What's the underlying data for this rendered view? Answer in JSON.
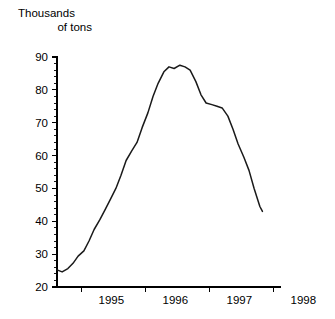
{
  "chart_data": {
    "type": "line",
    "title": "Thousands of tons",
    "title_line1": "Thousands",
    "title_line2": "of tons",
    "xlabel": "",
    "ylabel": "Thousands of tons",
    "ylim": [
      20,
      90
    ],
    "xlim": [
      "1994.62",
      "1997.83"
    ],
    "grid": false,
    "legend": false,
    "line_color": "#1a1a1a",
    "background_color": "#ffffff",
    "y_ticks": [
      20,
      30,
      40,
      50,
      60,
      70,
      80,
      90
    ],
    "y_tick_labels": [
      "20",
      "30",
      "40",
      "50",
      "60",
      "70",
      "80",
      "90"
    ],
    "y_minor_tick_step": 2,
    "x_ticks": [
      1995,
      1996,
      1997,
      1998
    ],
    "x_tick_labels": [
      "1995",
      "1996",
      "1997",
      "1998"
    ],
    "x": [
      1994.62,
      1994.7,
      1994.79,
      1994.87,
      1994.95,
      1995.04,
      1995.12,
      1995.2,
      1995.29,
      1995.37,
      1995.45,
      1995.54,
      1995.62,
      1995.7,
      1995.79,
      1995.87,
      1995.95,
      1996.04,
      1996.12,
      1996.2,
      1996.29,
      1996.37,
      1996.45,
      1996.54,
      1996.62,
      1996.7,
      1996.79,
      1996.87,
      1996.95,
      1997.04,
      1997.12,
      1997.2,
      1997.29,
      1997.37,
      1997.45,
      1997.54,
      1997.62,
      1997.7,
      1997.79,
      1997.83
    ],
    "values": [
      25.2,
      24.6,
      25.6,
      27.2,
      29.4,
      31.0,
      34.0,
      37.5,
      40.5,
      43.5,
      46.5,
      50.0,
      54.0,
      58.5,
      61.5,
      64.0,
      68.5,
      73.0,
      78.0,
      82.0,
      85.5,
      87.0,
      86.5,
      87.5,
      87.0,
      86.0,
      82.5,
      78.5,
      76.0,
      75.5,
      75.0,
      74.5,
      72.0,
      68.0,
      63.5,
      59.5,
      55.5,
      50.0,
      44.5,
      43.0
    ],
    "series_note_points": [
      {
        "label": "start",
        "x": 1994.62,
        "y": 25.2
      },
      {
        "label": "peak",
        "x": 1996.41,
        "y": 87.5
      },
      {
        "label": "shoulder",
        "x": 1997.1,
        "y": 75.0
      },
      {
        "label": "trough",
        "x": 1997.62,
        "y": 43.0
      },
      {
        "label": "end",
        "x": 1997.83,
        "y": 52.0
      }
    ]
  },
  "geometry": {
    "plot_left_px": 57,
    "plot_right_px": 281,
    "plot_top_px": 57,
    "plot_bottom_px": 287
  }
}
